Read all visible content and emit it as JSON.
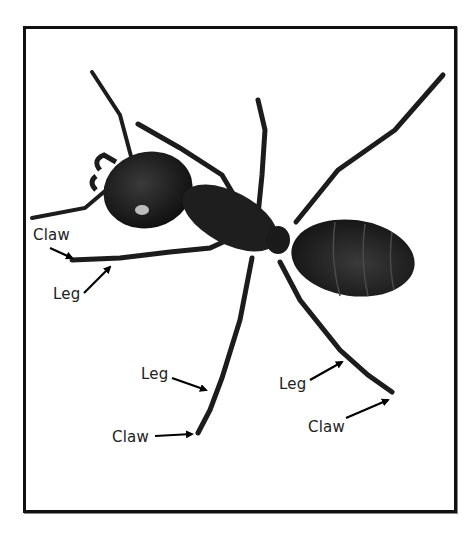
{
  "diagram": {
    "labels": [
      {
        "id": "claw-left",
        "text": "Claw",
        "target": "claw of left front leg"
      },
      {
        "id": "leg-left",
        "text": "Leg",
        "target": "left front leg"
      },
      {
        "id": "leg-bottom",
        "text": "Leg",
        "target": "left middle leg"
      },
      {
        "id": "claw-bottom",
        "text": "Claw",
        "target": "claw of left middle leg"
      },
      {
        "id": "leg-right",
        "text": "Leg",
        "target": "left hind leg"
      },
      {
        "id": "claw-right",
        "text": "Claw",
        "target": "claw of left hind leg"
      }
    ]
  },
  "colors": {
    "background": "#ffffff",
    "frame": "#111111",
    "ant_body": "#1c1c1c",
    "ant_highlight": "#3a3a3a",
    "label_text": "#222222",
    "arrow": "#000000"
  }
}
